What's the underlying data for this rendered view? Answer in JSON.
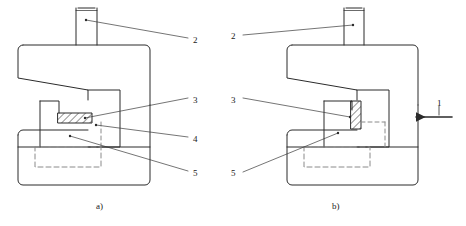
{
  "figure": {
    "background_color": "#ffffff",
    "line_color": "#2b2b2b",
    "hatch_color": "#2b2b2b",
    "dashed_color": "#8a8a8a"
  },
  "captions": [
    {
      "id": "caption-a",
      "text": "a)",
      "x": 96,
      "y": 201
    },
    {
      "id": "caption-b",
      "text": "b)",
      "x": 332,
      "y": 201
    }
  ],
  "callouts": [
    {
      "id": "callout-2-left",
      "number": "2",
      "x": 193,
      "y": 35,
      "view": "a"
    },
    {
      "id": "callout-3-left",
      "number": "3",
      "x": 193,
      "y": 95,
      "view": "a"
    },
    {
      "id": "callout-4-left",
      "number": "4",
      "x": 193,
      "y": 134,
      "view": "a"
    },
    {
      "id": "callout-5-left",
      "number": "5",
      "x": 193,
      "y": 168,
      "view": "a"
    },
    {
      "id": "callout-2-right",
      "number": "2",
      "x": 231,
      "y": 31,
      "view": "b"
    },
    {
      "id": "callout-3-right",
      "number": "3",
      "x": 231,
      "y": 95,
      "view": "b"
    },
    {
      "id": "callout-5-right",
      "number": "5",
      "x": 231,
      "y": 168,
      "view": "b"
    },
    {
      "id": "callout-1-force",
      "number": "1",
      "x": 437,
      "y": 100,
      "view": "b"
    }
  ],
  "force_arrow": {
    "id": "force-arrow",
    "direction": "left",
    "label": "1",
    "tip_x": 415,
    "tail_x": 452,
    "y": 117
  }
}
